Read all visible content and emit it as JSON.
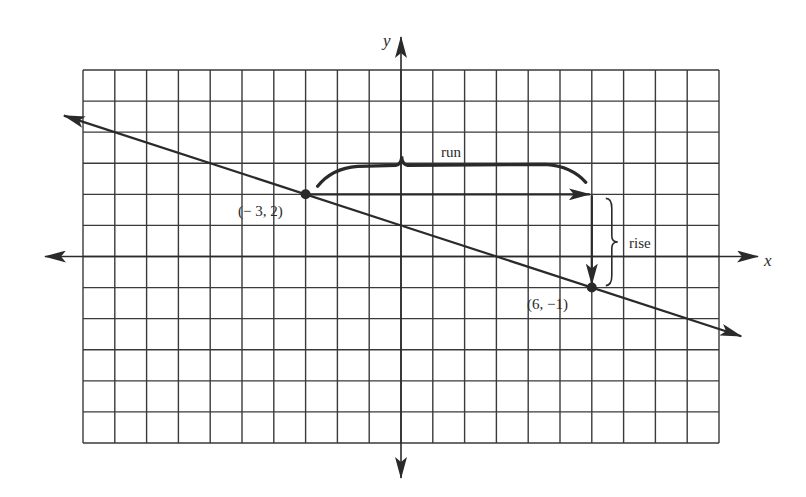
{
  "diagram": {
    "title": "",
    "colors": {
      "ink": "#2a2a2a",
      "grid": "#3a3a3a",
      "background": "#ffffff"
    },
    "grid": {
      "x_min": -10,
      "x_max": 10,
      "y_min": -6,
      "y_max": 6,
      "pixel_left": 83,
      "pixel_right": 719,
      "pixel_top": 70,
      "pixel_bottom": 443
    },
    "axes": {
      "x_label": "x",
      "y_label": "y"
    },
    "line": {
      "equation": "y = -x/3 + 1",
      "slope": -0.3333,
      "y_intercept": 1,
      "extends_with_arrows": true
    },
    "points": [
      {
        "label": "(− 3, 2)",
        "x": -3,
        "y": 2
      },
      {
        "label": "(6, −1)",
        "x": 6,
        "y": -1
      }
    ],
    "annotations": {
      "run_label": "run",
      "rise_label": "rise",
      "run_value": 9,
      "rise_value": -3
    }
  }
}
